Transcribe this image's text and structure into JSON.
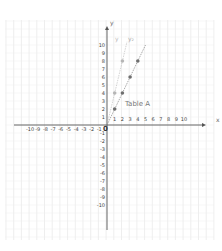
{
  "chart_data": {
    "type": "line",
    "title": "",
    "xlabel": "x",
    "ylabel": "y",
    "xlim": [
      -10,
      10
    ],
    "ylim": [
      -10,
      10
    ],
    "grid": true,
    "x_ticks": [
      -10,
      -9,
      -8,
      -7,
      -6,
      -5,
      -4,
      -3,
      -2,
      -1,
      1,
      2,
      3,
      4,
      5,
      6,
      7,
      8,
      9,
      10
    ],
    "y_ticks": [
      -10,
      -9,
      -8,
      -7,
      -6,
      -5,
      -4,
      -3,
      -2,
      -1,
      1,
      2,
      3,
      4,
      5,
      6,
      7,
      8,
      9,
      10
    ],
    "origin_label": "0",
    "series": [
      {
        "name": "y",
        "color": "#b5b5b5",
        "line_x": [
          0,
          2.6
        ],
        "line_y": [
          0,
          10.4
        ],
        "points": [
          {
            "x": 1,
            "y": 4
          },
          {
            "x": 2,
            "y": 8
          }
        ]
      },
      {
        "name": "y₂",
        "color": "#6e6e6e",
        "line_x": [
          0,
          5
        ],
        "line_y": [
          0,
          10
        ],
        "points": [
          {
            "x": 1,
            "y": 2
          },
          {
            "x": 2,
            "y": 4
          },
          {
            "x": 3,
            "y": 6
          },
          {
            "x": 4,
            "y": 8
          }
        ]
      }
    ],
    "annotations": [
      {
        "text": "Table A",
        "x": 2.4,
        "y": 2.7
      }
    ]
  },
  "labels": {
    "x_axis": "x",
    "y_axis": "y",
    "origin": "0",
    "series1": "y",
    "series2": "y₂",
    "annotation": "Table A"
  }
}
